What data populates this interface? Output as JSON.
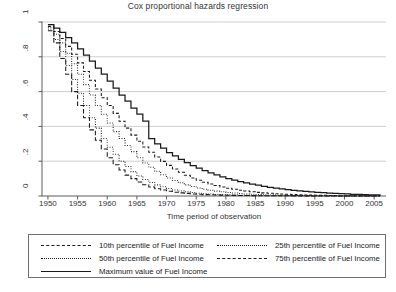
{
  "title": "Cox proportional hazards regression",
  "axes": {
    "ylabel": "Rate of revolutionary avoidance",
    "xlabel": "Time period of observation",
    "yticks": [
      "0",
      ".2",
      ".4",
      ".6",
      ".8",
      "1"
    ],
    "xticks": [
      "1950",
      "1955",
      "1960",
      "1965",
      "1970",
      "1975",
      "1980",
      "1985",
      "1990",
      "1995",
      "2000",
      "2005"
    ]
  },
  "legend": {
    "items": [
      {
        "label": "10th percentile of Fuel Income",
        "style": "longdash"
      },
      {
        "label": "25th percentile of Fuel Income",
        "style": "finedot"
      },
      {
        "label": "50th percentile of Fuel Income",
        "style": "finedot"
      },
      {
        "label": "75th percentile of Fuel Income",
        "style": "dash"
      },
      {
        "label": "Maximum value of Fuel Income",
        "style": "solid"
      }
    ]
  },
  "chart_data": {
    "type": "line",
    "title": "Cox proportional hazards regression",
    "xlabel": "Time period of observation",
    "ylabel": "Rate of revolutionary avoidance",
    "xlim": [
      1949,
      2007
    ],
    "ylim": [
      0,
      1
    ],
    "grid": "horizontal",
    "legend_position": "below-plot",
    "step": "survival step function",
    "x": [
      1950,
      1951,
      1952,
      1953,
      1954,
      1955,
      1956,
      1957,
      1958,
      1959,
      1960,
      1961,
      1962,
      1963,
      1964,
      1965,
      1966,
      1967,
      1968,
      1969,
      1970,
      1971,
      1972,
      1973,
      1974,
      1975,
      1976,
      1977,
      1978,
      1979,
      1980,
      1981,
      1982,
      1983,
      1984,
      1985,
      1986,
      1987,
      1988,
      1989,
      1990,
      1991,
      1992,
      1993,
      1994,
      1995,
      1996,
      1997,
      1998,
      1999,
      2000,
      2001,
      2002,
      2003,
      2004,
      2005,
      2006
    ],
    "series": [
      {
        "name": "10th percentile of Fuel Income",
        "style": "longdash",
        "color": "#1a1a1a",
        "values": [
          0.95,
          0.88,
          0.79,
          0.7,
          0.6,
          0.52,
          0.45,
          0.38,
          0.32,
          0.27,
          0.22,
          0.18,
          0.15,
          0.12,
          0.1,
          0.08,
          0.065,
          0.052,
          0.042,
          0.034,
          0.027,
          0.022,
          0.018,
          0.015,
          0.012,
          0.01,
          0.008,
          0.007,
          0.006,
          0.005,
          0.004,
          0.0035,
          0.003,
          0.0026,
          0.0022,
          0.0019,
          0.0016,
          0.0014,
          0.0012,
          0.001,
          0.0009,
          0.0008,
          0.0007,
          0.0006,
          0.0005,
          0.0004,
          0.0004,
          0.0003,
          0.0003,
          0.0002,
          0.0002,
          0.0002,
          0.0001,
          0.0001,
          0.0001,
          0.0001,
          0.0001
        ]
      },
      {
        "name": "25th percentile of Fuel Income",
        "style": "finedot",
        "color": "#1a1a1a",
        "values": [
          0.96,
          0.9,
          0.83,
          0.75,
          0.67,
          0.59,
          0.52,
          0.45,
          0.39,
          0.33,
          0.28,
          0.24,
          0.2,
          0.17,
          0.14,
          0.115,
          0.095,
          0.078,
          0.064,
          0.053,
          0.043,
          0.035,
          0.029,
          0.024,
          0.02,
          0.016,
          0.013,
          0.011,
          0.009,
          0.008,
          0.0065,
          0.0055,
          0.0046,
          0.0039,
          0.0033,
          0.0028,
          0.0024,
          0.002,
          0.0017,
          0.0015,
          0.0013,
          0.0011,
          0.0009,
          0.0008,
          0.0007,
          0.0006,
          0.0005,
          0.0004,
          0.0004,
          0.0003,
          0.0003,
          0.0002,
          0.0002,
          0.0002,
          0.0001,
          0.0001,
          0.0001
        ]
      },
      {
        "name": "50th percentile of Fuel Income",
        "style": "finedot",
        "color": "#1a1a1a",
        "values": [
          0.97,
          0.93,
          0.88,
          0.82,
          0.76,
          0.7,
          0.64,
          0.58,
          0.52,
          0.47,
          0.42,
          0.37,
          0.33,
          0.29,
          0.255,
          0.22,
          0.19,
          0.165,
          0.142,
          0.122,
          0.104,
          0.089,
          0.076,
          0.064,
          0.055,
          0.046,
          0.039,
          0.033,
          0.028,
          0.024,
          0.02,
          0.017,
          0.014,
          0.012,
          0.01,
          0.0085,
          0.0072,
          0.0061,
          0.0051,
          0.0043,
          0.0037,
          0.0031,
          0.0026,
          0.0022,
          0.0019,
          0.0016,
          0.0013,
          0.0011,
          0.0009,
          0.0008,
          0.0007,
          0.0006,
          0.0005,
          0.0004,
          0.0003,
          0.0003,
          0.0002
        ]
      },
      {
        "name": "75th percentile of Fuel Income",
        "style": "dash",
        "color": "#1a1a1a",
        "values": [
          0.975,
          0.945,
          0.905,
          0.86,
          0.815,
          0.765,
          0.715,
          0.665,
          0.615,
          0.565,
          0.52,
          0.475,
          0.43,
          0.39,
          0.35,
          0.315,
          0.282,
          0.252,
          0.224,
          0.199,
          0.176,
          0.155,
          0.136,
          0.119,
          0.104,
          0.091,
          0.079,
          0.069,
          0.06,
          0.052,
          0.045,
          0.039,
          0.033,
          0.029,
          0.025,
          0.021,
          0.018,
          0.016,
          0.013,
          0.011,
          0.01,
          0.008,
          0.007,
          0.006,
          0.005,
          0.004,
          0.004,
          0.003,
          0.003,
          0.002,
          0.002,
          0.002,
          0.001,
          0.001,
          0.001,
          0.001,
          0.001
        ]
      },
      {
        "name": "Maximum value of Fuel Income",
        "style": "solid",
        "color": "#1a1a1a",
        "values": [
          0.985,
          0.965,
          0.94,
          0.91,
          0.88,
          0.845,
          0.81,
          0.775,
          0.735,
          0.7,
          0.66,
          0.62,
          0.58,
          0.545,
          0.505,
          0.47,
          0.43,
          0.33,
          0.3,
          0.275,
          0.25,
          0.23,
          0.21,
          0.192,
          0.175,
          0.16,
          0.146,
          0.133,
          0.121,
          0.11,
          0.1,
          0.091,
          0.083,
          0.075,
          0.068,
          0.062,
          0.056,
          0.05,
          0.045,
          0.041,
          0.037,
          0.033,
          0.03,
          0.027,
          0.024,
          0.021,
          0.019,
          0.017,
          0.015,
          0.013,
          0.012,
          0.01,
          0.009,
          0.008,
          0.007,
          0.006,
          0.005
        ]
      }
    ]
  }
}
